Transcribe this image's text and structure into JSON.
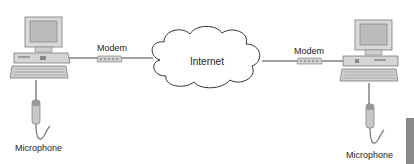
{
  "labels": {
    "modem_left": "Modem",
    "modem_right": "Modem",
    "internet": "Internet",
    "microphone_left": "Microphone",
    "microphone_right": "Microphone"
  },
  "icons": {
    "computer": "desktop-computer-icon",
    "modem": "modem-icon",
    "cloud": "cloud-icon",
    "microphone": "microphone-icon"
  },
  "colors": {
    "line": "#444444",
    "device_body": "#d9d9d9",
    "device_edge": "#8c8c8c",
    "screen": "#b8b8b8",
    "tab": "#8a8a8a"
  }
}
